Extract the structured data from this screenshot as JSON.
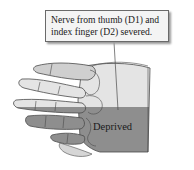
{
  "callout": {
    "line1": "Nerve from thumb (D1) and",
    "line2": "index finger (D2) severed."
  },
  "regions": {
    "deprived_label": "Deprived"
  },
  "colors": {
    "intact_skin": "#e4e4e4",
    "deprived_skin": "#8e8e8e",
    "outline": "#4a4a4a",
    "callout_bg": "#f4f4f4",
    "background": "#ffffff"
  }
}
